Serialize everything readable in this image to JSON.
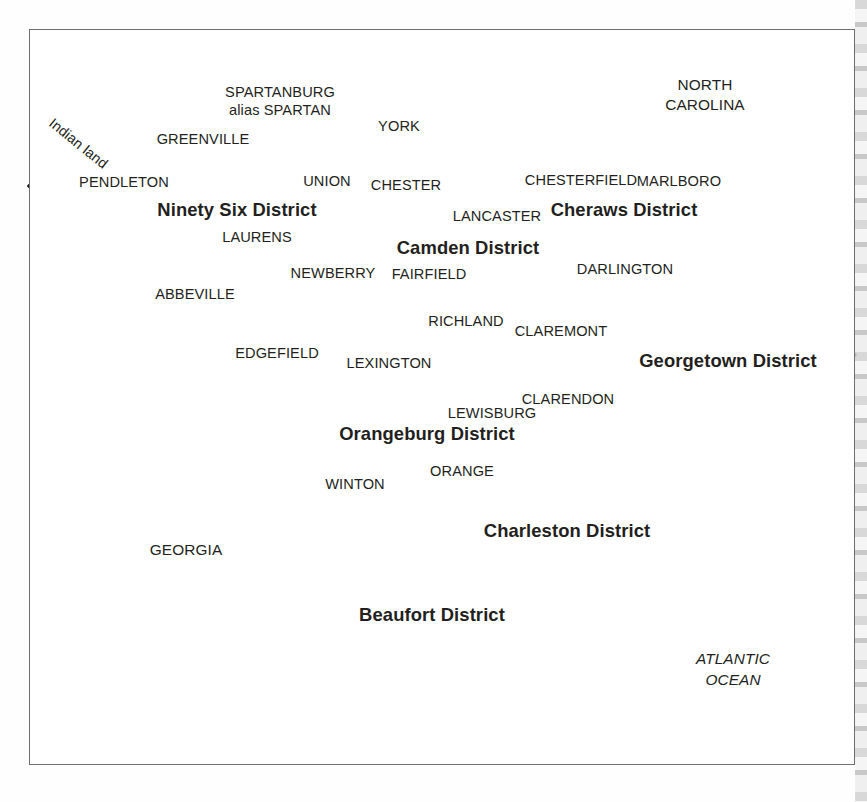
{
  "map": {
    "title": "South Carolina Judicial Districts and Counties",
    "frame": {
      "x": 29,
      "y": 29,
      "width": 826,
      "height": 736
    },
    "colors": {
      "background": "#ffffff",
      "frame_border": "#6d6e71",
      "district_boundary": "#231f20",
      "county_boundary": "#58595b",
      "text": "#231f20"
    },
    "districts": [
      {
        "name": "Ninety Six District",
        "x": 237,
        "y": 209
      },
      {
        "name": "Camden District",
        "x": 468,
        "y": 247
      },
      {
        "name": "Cheraws District",
        "x": 624,
        "y": 209
      },
      {
        "name": "Georgetown District",
        "x": 728,
        "y": 360,
        "line2": "District"
      },
      {
        "name": "Orangeburg District",
        "x": 427,
        "y": 433
      },
      {
        "name": "Charleston District",
        "x": 567,
        "y": 533,
        "line2": "District"
      },
      {
        "name": "Beaufort District",
        "x": 432,
        "y": 617,
        "line2": "District"
      }
    ],
    "counties": [
      {
        "name": "PENDLETON",
        "x": 124,
        "y": 182
      },
      {
        "name": "GREENVILLE",
        "x": 203,
        "y": 139
      },
      {
        "name": "SPARTANBURG",
        "x": 280,
        "y": 92
      },
      {
        "name": "alias SPARTAN",
        "x": 280,
        "y": 110
      },
      {
        "name": "UNION",
        "x": 327,
        "y": 181
      },
      {
        "name": "YORK",
        "x": 399,
        "y": 126
      },
      {
        "name": "CHESTER",
        "x": 406,
        "y": 185
      },
      {
        "name": "LANCASTER",
        "x": 497,
        "y": 216
      },
      {
        "name": "CHESTERFIELD",
        "x": 581,
        "y": 180
      },
      {
        "name": "MARLBORO",
        "x": 679,
        "y": 181
      },
      {
        "name": "LAURENS",
        "x": 257,
        "y": 237
      },
      {
        "name": "NEWBERRY",
        "x": 333,
        "y": 273
      },
      {
        "name": "ABBEVILLE",
        "x": 195,
        "y": 294
      },
      {
        "name": "EDGEFIELD",
        "x": 277,
        "y": 353
      },
      {
        "name": "FAIRFIELD",
        "x": 429,
        "y": 274
      },
      {
        "name": "RICHLAND",
        "x": 466,
        "y": 321
      },
      {
        "name": "CLAREMONT",
        "x": 561,
        "y": 331
      },
      {
        "name": "DARLINGTON",
        "x": 625,
        "y": 269
      },
      {
        "name": "LEXINGTON",
        "x": 389,
        "y": 363
      },
      {
        "name": "CLARENDON",
        "x": 568,
        "y": 399
      },
      {
        "name": "LEWISBURG",
        "x": 492,
        "y": 413
      },
      {
        "name": "ORANGE",
        "x": 462,
        "y": 471
      },
      {
        "name": "WINTON",
        "x": 355,
        "y": 484
      }
    ],
    "regions": [
      {
        "name": "Indian land",
        "x": 78,
        "y": 144,
        "style": "rotated"
      },
      {
        "name": "NORTH",
        "x": 705,
        "y": 85,
        "style": "state"
      },
      {
        "name": "CAROLINA",
        "x": 705,
        "y": 105,
        "style": "state"
      },
      {
        "name": "GEORGIA",
        "x": 186,
        "y": 549,
        "style": "state"
      },
      {
        "name": "ATLANTIC",
        "x": 733,
        "y": 659,
        "style": "ocean"
      },
      {
        "name": "OCEAN",
        "x": 733,
        "y": 680,
        "style": "ocean"
      }
    ]
  }
}
